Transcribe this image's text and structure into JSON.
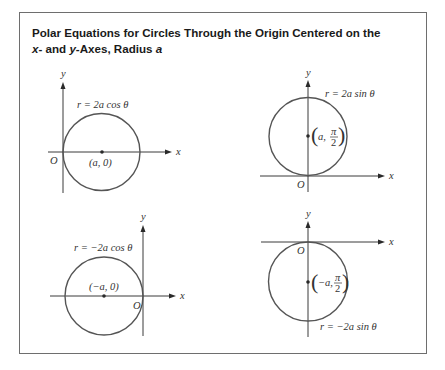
{
  "title": {
    "line1": "Polar Equations for Circles Through the Origin Centered on the",
    "line2_prefix_x": "x",
    "line2_mid1": "- and ",
    "line2_y": "y",
    "line2_mid2": "-Axes, Radius ",
    "line2_a": "a"
  },
  "panels": [
    {
      "id": "cos-positive",
      "equation": "r = 2a cos θ",
      "center_label": "(a, 0)",
      "origin_label": "O",
      "x_label": "x",
      "y_label": "y"
    },
    {
      "id": "sin-positive",
      "equation": "r = 2a sin θ",
      "center_label_a": "a,",
      "center_label_num": "π",
      "center_label_den": "2",
      "origin_label": "O",
      "x_label": "x",
      "y_label": "y"
    },
    {
      "id": "cos-negative",
      "equation": "r = −2a cos θ",
      "center_label": "(−a, 0)",
      "origin_label": "O",
      "x_label": "x",
      "y_label": "y"
    },
    {
      "id": "sin-negative",
      "equation": "r = −2a sin θ",
      "center_label_a": "−a,",
      "center_label_num": "π",
      "center_label_den": "2",
      "origin_label": "O",
      "x_label": "x",
      "y_label": "y"
    }
  ],
  "colors": {
    "frame": "#6e6e6e",
    "circle": "#555555",
    "axis": "#3a3a3a",
    "text": "#333333"
  }
}
